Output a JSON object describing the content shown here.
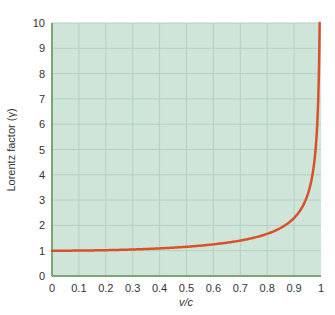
{
  "chart_data": {
    "type": "line",
    "title": "",
    "xlabel": "v/c",
    "ylabel": "Lorentz factor (γ)",
    "xlim": [
      0,
      1
    ],
    "ylim": [
      0,
      10
    ],
    "x_ticks": [
      "0",
      "0.1",
      "0.2",
      "0.3",
      "0.4",
      "0.5",
      "0.6",
      "0.7",
      "0.8",
      "0.9",
      "1"
    ],
    "y_ticks": [
      "0",
      "1",
      "2",
      "3",
      "4",
      "5",
      "6",
      "7",
      "8",
      "9",
      "10"
    ],
    "grid": true,
    "legend": null,
    "series": [
      {
        "name": "Lorentz factor",
        "color": "#d9502a",
        "x": [
          0,
          0.1,
          0.2,
          0.3,
          0.4,
          0.5,
          0.6,
          0.7,
          0.8,
          0.85,
          0.9,
          0.93,
          0.95,
          0.97,
          0.98,
          0.99,
          0.995
        ],
        "y": [
          1.0,
          1.005,
          1.02,
          1.048,
          1.091,
          1.155,
          1.25,
          1.4,
          1.667,
          1.898,
          2.294,
          2.72,
          3.203,
          4.113,
          5.025,
          7.089,
          10.0
        ]
      }
    ]
  },
  "colors": {
    "plot_bg": "#cfe5da",
    "grid": "#b4cfc1",
    "axis": "#7aa66f",
    "curve": "#d9502a"
  }
}
